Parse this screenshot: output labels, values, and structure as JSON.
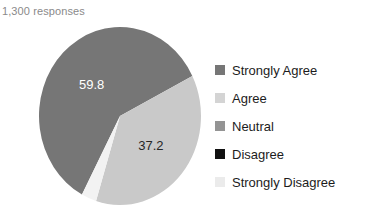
{
  "subtitle": "1,300 responses",
  "title_clipped": "y",
  "legend": {
    "position": "right",
    "items": [
      {
        "label": "Strongly Agree",
        "color": "#767676"
      },
      {
        "label": "Agree",
        "color": "#d4d4d4"
      },
      {
        "label": "Neutral",
        "color": "#949494"
      },
      {
        "label": "Disagree",
        "color": "#111111"
      },
      {
        "label": "Strongly Disagree",
        "color": "#ebebeb"
      }
    ]
  },
  "chart_data": {
    "type": "pie",
    "title": "",
    "subtitle": "1,300 responses",
    "xlabel": "",
    "ylabel": "",
    "grid": false,
    "legend_position": "right",
    "total_responses": 1300,
    "labels": [
      "Strongly Agree",
      "Agree",
      "Neutral",
      "Disagree",
      "Strongly Disagree"
    ],
    "values": [
      59.8,
      37.2,
      0,
      0,
      3.0
    ],
    "visible_data_labels": [
      "59.8",
      "37.2"
    ],
    "slices": [
      {
        "label": "Strongly Agree",
        "value": 59.8,
        "data_label": "59.8",
        "color": "#767676",
        "label_color": "#ffffff"
      },
      {
        "label": "Agree",
        "value": 37.2,
        "data_label": "37.2",
        "color": "#c9c9c9",
        "label_color": "#262626"
      },
      {
        "label": "Neutral",
        "value": 0,
        "data_label": "",
        "color": "#949494",
        "label_color": "#262626"
      },
      {
        "label": "Disagree",
        "value": 0,
        "data_label": "",
        "color": "#111111",
        "label_color": "#ffffff"
      },
      {
        "label": "Strongly Disagree",
        "value": 3.0,
        "data_label": "",
        "color": "#f2f2f2",
        "label_color": "#262626"
      }
    ]
  }
}
